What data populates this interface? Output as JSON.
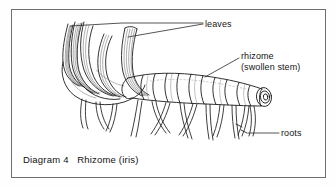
{
  "figure": {
    "title": "Diagram 4   Rhizome (iris)",
    "caption_number": "Diagram 4",
    "caption_name": "Rhizome (iris)",
    "background_color": "#ffffff",
    "ink_color": "#1a1a1a",
    "frame_color": "#6e6e6e"
  },
  "labels": {
    "leaves": "leaves",
    "rhizome_line1": "rhizome",
    "rhizome_line2": "(swollen stem)",
    "roots": "roots"
  },
  "parts": {
    "leaf_fan": "leaf-fan",
    "rhizome_body": "rhizome-body",
    "cut_end": "cut-cross-section",
    "root_cluster": "root-cluster"
  }
}
